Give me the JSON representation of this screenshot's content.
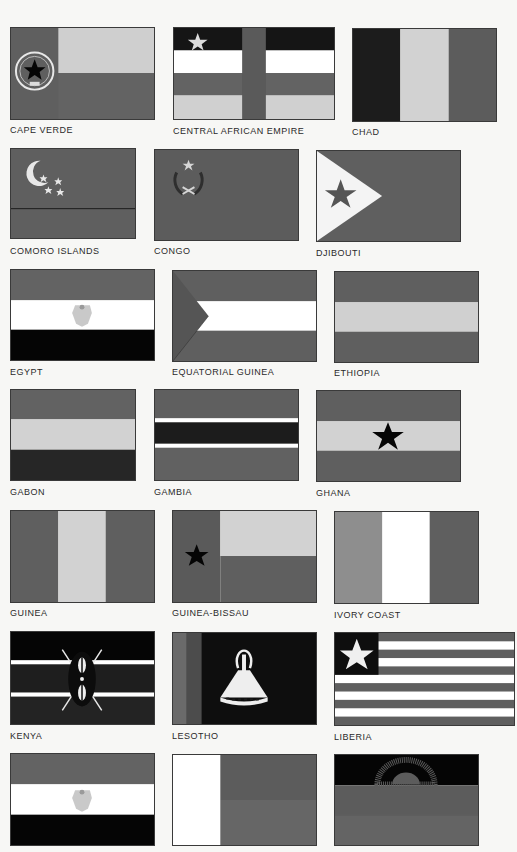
{
  "colors": {
    "background": "#f7f7f5",
    "dark": "#151515",
    "mid_gray": "#5f5f5f",
    "mid_gray_2": "#676767",
    "light_gray": "#cfcfcf",
    "white": "#ffffff",
    "black": "#050505"
  },
  "flags": [
    {
      "id": "cape-verde",
      "label": "CAPE VERDE"
    },
    {
      "id": "central-african-empire",
      "label": "CENTRAL AFRICAN EMPIRE"
    },
    {
      "id": "chad",
      "label": "CHAD"
    },
    {
      "id": "comoro-islands",
      "label": "COMORO ISLANDS"
    },
    {
      "id": "congo",
      "label": "CONGO"
    },
    {
      "id": "djibouti",
      "label": "DJIBOUTI"
    },
    {
      "id": "egypt",
      "label": "EGYPT"
    },
    {
      "id": "equatorial-guinea",
      "label": "EQUATORIAL GUINEA"
    },
    {
      "id": "ethiopia",
      "label": "ETHIOPIA"
    },
    {
      "id": "gabon",
      "label": "GABON"
    },
    {
      "id": "gambia",
      "label": "GAMBIA"
    },
    {
      "id": "ghana",
      "label": "GHANA"
    },
    {
      "id": "guinea",
      "label": "GUINEA"
    },
    {
      "id": "guinea-bissau",
      "label": "GUINEA-BISSAU"
    },
    {
      "id": "ivory-coast",
      "label": "IVORY COAST"
    },
    {
      "id": "kenya",
      "label": "KENYA"
    },
    {
      "id": "lesotho",
      "label": "LESOTHO"
    },
    {
      "id": "liberia",
      "label": "LIBERIA"
    },
    {
      "id": "libya-style-flag",
      "label": ""
    },
    {
      "id": "madagascar",
      "label": ""
    },
    {
      "id": "malawi",
      "label": ""
    }
  ]
}
